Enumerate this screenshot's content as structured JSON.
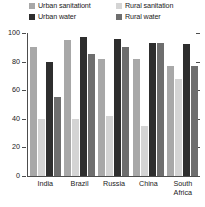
{
  "chart_data": {
    "type": "bar",
    "title": "",
    "subtitle": "",
    "xlabel": "",
    "ylabel": "",
    "ylim": [
      0,
      100
    ],
    "yticks": [
      0,
      20,
      40,
      60,
      80,
      100
    ],
    "ytick_labels": [
      "0",
      "20",
      "40",
      "60",
      "80",
      "100"
    ],
    "grid": false,
    "legend_position": "top",
    "categories": [
      "India",
      "Brazil",
      "Russia",
      "China",
      "South\nAfrica"
    ],
    "series": [
      {
        "name": "Urban sanitationt",
        "color": "#a8a8a8",
        "values": [
          90,
          95,
          82,
          82,
          77
        ]
      },
      {
        "name": "Rural sanitation",
        "color": "#d4d4d4",
        "values": [
          40,
          40,
          42,
          35,
          68
        ]
      },
      {
        "name": "Urban water",
        "color": "#2e2e2e",
        "values": [
          80,
          97,
          96,
          93,
          92
        ]
      },
      {
        "name": "Rural water",
        "color": "#6e6e6e",
        "values": [
          55,
          85,
          90,
          93,
          77
        ]
      }
    ]
  },
  "legend": {
    "items": [
      {
        "label": "Urban sanitationt",
        "color": "#a8a8a8"
      },
      {
        "label": "Urban water",
        "color": "#2e2e2e"
      },
      {
        "label": "Rural sanitation",
        "color": "#d4d4d4"
      },
      {
        "label": "Rural water",
        "color": "#6e6e6e"
      }
    ]
  },
  "axis": {
    "y_labels": [
      "100",
      "80",
      "60",
      "40",
      "20",
      "0"
    ]
  }
}
